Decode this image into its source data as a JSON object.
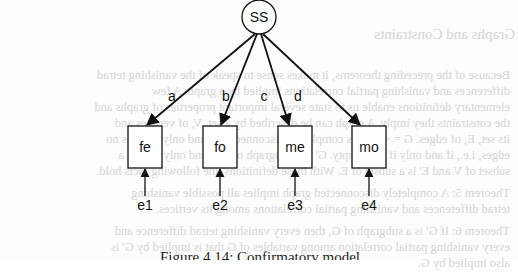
{
  "diagram": {
    "latent_node": {
      "id": "SS",
      "label": "SS",
      "cx": 259,
      "cy": 17,
      "r": 17
    },
    "observed_nodes": [
      {
        "id": "fe",
        "label": "fe",
        "x": 128,
        "y": 126,
        "w": 34,
        "h": 42
      },
      {
        "id": "fo",
        "label": "fo",
        "x": 203,
        "y": 126,
        "w": 34,
        "h": 42
      },
      {
        "id": "me",
        "label": "me",
        "x": 278,
        "y": 126,
        "w": 34,
        "h": 42
      },
      {
        "id": "mo",
        "label": "mo",
        "x": 352,
        "y": 126,
        "w": 34,
        "h": 42
      }
    ],
    "loadings": [
      {
        "from": "SS",
        "to": "fe",
        "label": "a"
      },
      {
        "from": "SS",
        "to": "fo",
        "label": "b"
      },
      {
        "from": "SS",
        "to": "me",
        "label": "c"
      },
      {
        "from": "SS",
        "to": "mo",
        "label": "d"
      }
    ],
    "errors": [
      {
        "label": "e1",
        "to": "fe"
      },
      {
        "label": "e2",
        "to": "fo"
      },
      {
        "label": "e3",
        "to": "me"
      },
      {
        "label": "e4",
        "to": "mo"
      }
    ],
    "colors": {
      "stroke": "#111111",
      "text": "#111111",
      "background": "#fdfdfd",
      "bleed_text": "#d4d4d4"
    }
  },
  "caption": "Figure 4.14: Confirmatory model",
  "bleed_through": {
    "heading": "Graphs and Constraints",
    "lines": [
      "Because of the preceding theorems, it makes sense to speak of the vanishing tetrad",
      "differences and vanishing partial correlations implied by a graph.  A few",
      "elementary definitions enable us to state several important properties of graphs and",
      "the constraints they imply.  A graph can be described by a set, V, of vertices and",
      "its set, E, of edges. G = <V,E> is completely disconnected if and only if it has no",
      "edges, i.e., if and only if E is empty. G' is a subgraph of G if and only if V' is a",
      "subset of V and E' is a subset of E. With these definitions, the following facts hold.",
      "Theorem 5:  A completely disconnected graph implies all possible vanishing",
      "tetrad differences and vanishing partial correlations among its vertices.",
      "Theorem 6:  If G' is a subgraph of G, then every vanishing tetrad difference and",
      "every vanishing partial correlation among variables of G that is implied by G' is",
      "also implied by G."
    ]
  }
}
